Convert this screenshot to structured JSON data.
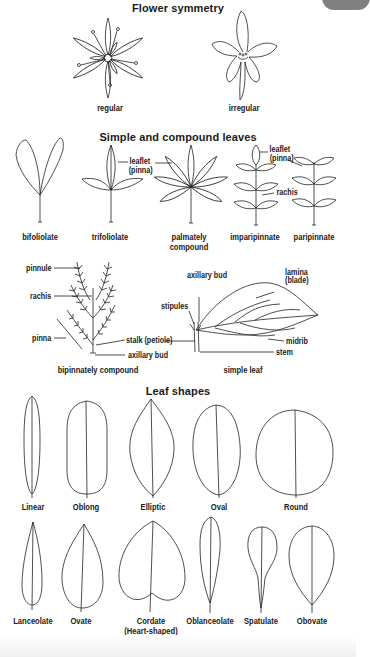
{
  "sections": {
    "flower_symmetry": {
      "title": "Flower symmetry",
      "items": [
        {
          "label": "regular"
        },
        {
          "label": "irregular"
        }
      ]
    },
    "simple_compound": {
      "title": "Simple and compound leaves",
      "items": [
        {
          "label": "bifoliolate"
        },
        {
          "label": "trifoliolate"
        },
        {
          "label": "palmately",
          "label2": "compound"
        },
        {
          "label": "imparipinnate"
        },
        {
          "label": "paripinnate"
        }
      ],
      "annotations": {
        "leaflet_1": "leaflet",
        "pinna_1": "(pinna)",
        "leaflet_2": "leaflet",
        "pinna_2": "(pinna)",
        "rachis_1": "rachis"
      },
      "bipinnate": {
        "caption": "bipinnately compound",
        "pinnule": "pinnule",
        "rachis": "rachis",
        "pinna": "pinna",
        "stalk": "stalk (petiole)",
        "axillary_bud": "axillary bud"
      },
      "simple_leaf": {
        "caption": "simple leaf",
        "axillary_bud": "axillary bud",
        "lamina": "lamina",
        "blade": "(blade)",
        "stipules": "stipules",
        "midrib": "midrib",
        "stem": "stem"
      }
    },
    "leaf_shapes": {
      "title": "Leaf shapes",
      "row1": [
        {
          "label": "Linear"
        },
        {
          "label": "Oblong"
        },
        {
          "label": "Elliptic"
        },
        {
          "label": "Oval"
        },
        {
          "label": "Round"
        }
      ],
      "row2": [
        {
          "label": "Lanceolate"
        },
        {
          "label": "Ovate"
        },
        {
          "label": "Cordate",
          "label2": "(Heart-shaped)"
        },
        {
          "label": "Oblanceolate"
        },
        {
          "label": "Spatulate"
        },
        {
          "label": "Obovate"
        }
      ]
    }
  }
}
